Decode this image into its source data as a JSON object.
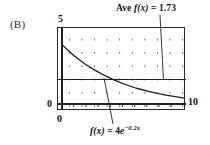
{
  "panel": {
    "label": "(B)"
  },
  "axes": {
    "y_top_label": "5",
    "origin_label": "0",
    "x_zero_label": "0",
    "x_max_label": "10"
  },
  "annotations": {
    "average": {
      "prefix": "Ave ",
      "fn": "f(x)",
      "equals": " = ",
      "value": "1.73"
    },
    "function": {
      "fn": "f(x)",
      "equals": " = ",
      "coefficient": "4",
      "base": "e",
      "exponent": "−0.2x"
    }
  },
  "colors": {
    "curve": "#1f1f1f",
    "average_line": "#1f1f1f",
    "frame": "#2a2a2a",
    "grid_dot": "#6d6d6d",
    "background": "#ffffff"
  },
  "chart_data": {
    "type": "line",
    "title": "",
    "xlabel": "",
    "ylabel": "",
    "xlim": [
      0,
      10
    ],
    "ylim": [
      0,
      5
    ],
    "grid": true,
    "grid_style": "dots",
    "legend": "none",
    "series": [
      {
        "name": "f(x) = 4e^(-0.2x)",
        "type": "line",
        "x": [
          0,
          0.5,
          1,
          1.5,
          2,
          2.5,
          3,
          3.5,
          4,
          4.5,
          5,
          5.5,
          6,
          6.5,
          7,
          7.5,
          8,
          8.5,
          9,
          9.5,
          10
        ],
        "y": [
          4.0,
          3.62,
          3.27,
          2.96,
          2.68,
          2.43,
          2.2,
          1.99,
          1.8,
          1.63,
          1.47,
          1.33,
          1.2,
          1.09,
          0.99,
          0.89,
          0.81,
          0.73,
          0.66,
          0.6,
          0.54
        ]
      },
      {
        "name": "Ave f(x) = 1.73",
        "type": "hline",
        "value": 1.73
      }
    ],
    "annotations": [
      {
        "text": "Ave f(x) = 1.73",
        "points_to": "horizontal average line",
        "x": 8.3,
        "y": 1.73
      },
      {
        "text": "f(x) = 4e^-0.2x",
        "points_to": "exponential curve",
        "x": 5.2,
        "y": 1.42
      }
    ]
  }
}
